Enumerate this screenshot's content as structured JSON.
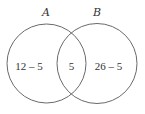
{
  "diagram": {
    "type": "venn",
    "sets": [
      {
        "id": "A",
        "label": "A"
      },
      {
        "id": "B",
        "label": "B"
      }
    ],
    "regions": {
      "a_only": "12 – 5",
      "intersection": "5",
      "b_only": "26 – 5"
    },
    "colors": {
      "stroke": "#6a6a6a",
      "text": "#333333",
      "background": "#ffffff"
    }
  }
}
